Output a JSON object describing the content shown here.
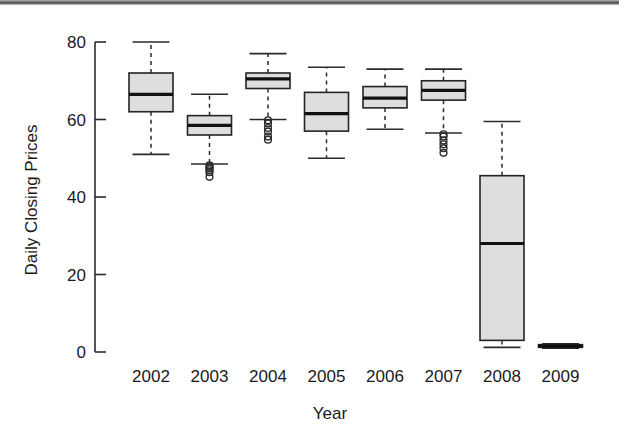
{
  "chart_data": {
    "type": "box",
    "title": "",
    "xlabel": "Year",
    "ylabel": "Daily Closing Prices",
    "categories": [
      "2002",
      "2003",
      "2004",
      "2005",
      "2006",
      "2007",
      "2008",
      "2009"
    ],
    "ylim": [
      -2,
      82
    ],
    "yticks": [
      0,
      20,
      40,
      60,
      80
    ],
    "ytick_labels": [
      "0",
      "20",
      "40",
      "60",
      "80"
    ],
    "grid": false,
    "legend": "none",
    "box_fill_color": "#dedede",
    "line_color": "#242424",
    "boxes": [
      {
        "category": "2002",
        "whisker_low": 51.0,
        "q1": 62.0,
        "median": 66.5,
        "q3": 72.0,
        "whisker_high": 80.0,
        "outliers": []
      },
      {
        "category": "2003",
        "whisker_low": 48.5,
        "q1": 56.0,
        "median": 58.5,
        "q3": 61.0,
        "whisker_high": 66.5,
        "outliers": [
          48.2,
          47.8,
          47.4,
          46.9,
          46.4,
          45.2
        ]
      },
      {
        "category": "2004",
        "whisker_low": 60.0,
        "q1": 68.0,
        "median": 70.5,
        "q3": 72.0,
        "whisker_high": 77.0,
        "outliers": [
          59.8,
          59.0,
          57.8,
          56.9,
          55.6,
          54.8
        ]
      },
      {
        "category": "2005",
        "whisker_low": 50.0,
        "q1": 57.0,
        "median": 61.5,
        "q3": 67.0,
        "whisker_high": 73.5,
        "outliers": []
      },
      {
        "category": "2006",
        "whisker_low": 57.5,
        "q1": 63.0,
        "median": 65.5,
        "q3": 68.5,
        "whisker_high": 73.0,
        "outliers": []
      },
      {
        "category": "2007",
        "whisker_low": 56.5,
        "q1": 65.0,
        "median": 67.5,
        "q3": 70.0,
        "whisker_high": 73.0,
        "outliers": [
          56.2,
          55.6,
          54.6,
          53.6,
          52.6,
          51.4
        ]
      },
      {
        "category": "2008",
        "whisker_low": 1.2,
        "q1": 3.0,
        "median": 28.0,
        "q3": 45.5,
        "whisker_high": 59.5,
        "outliers": []
      },
      {
        "category": "2009",
        "whisker_low": 1.0,
        "q1": 1.2,
        "median": 1.5,
        "q3": 1.9,
        "whisker_high": 2.1,
        "outliers": []
      }
    ]
  }
}
